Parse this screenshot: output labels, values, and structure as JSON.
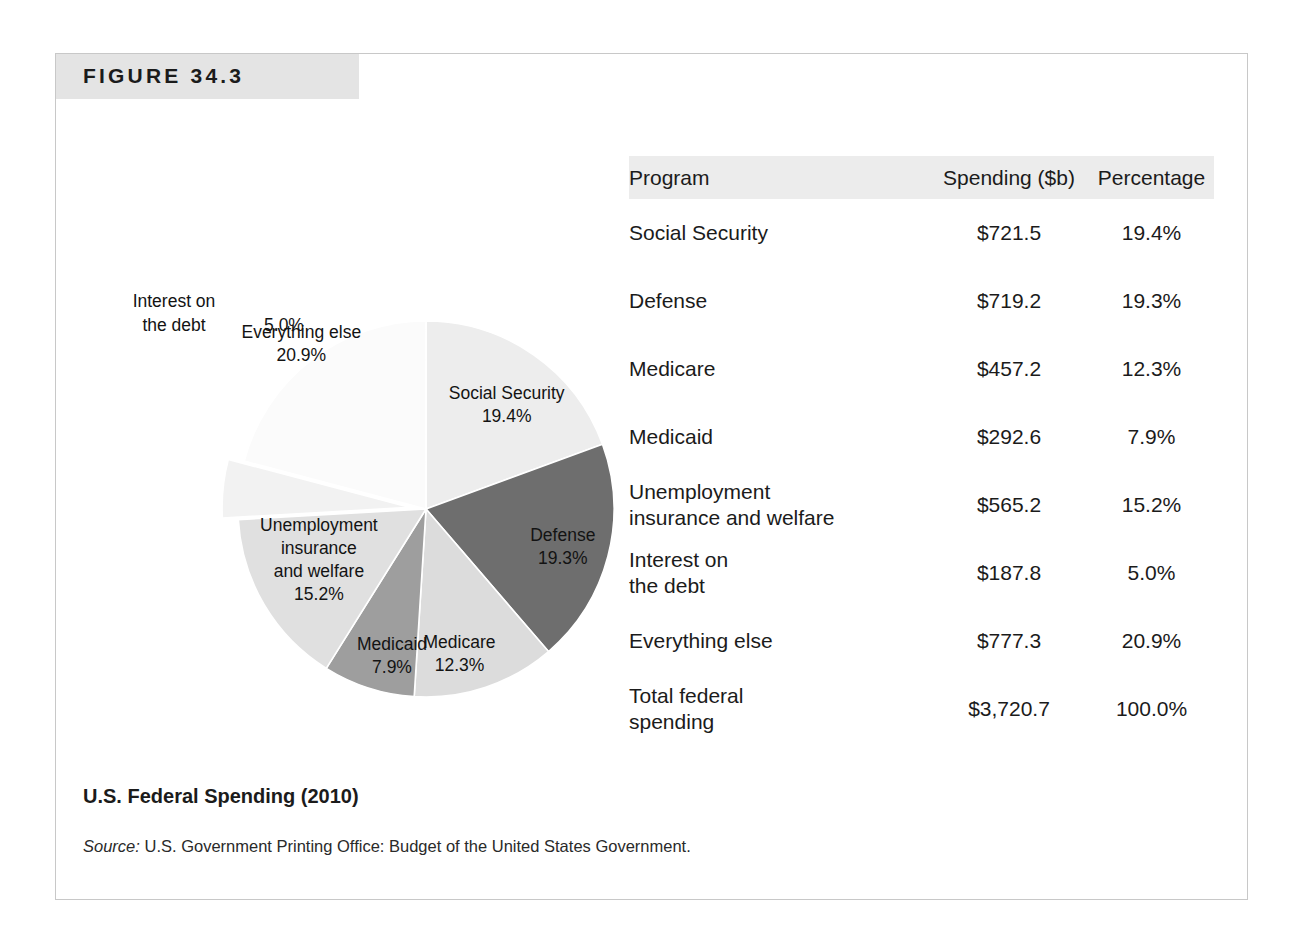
{
  "figure": {
    "number_label": "FIGURE 34.3",
    "caption_title": "U.S. Federal Spending (2010)",
    "source_word": "Source:",
    "source_text": " U.S. Government Printing Office: Budget of the United States Government."
  },
  "table": {
    "headers": {
      "program": "Program",
      "spending": "Spending ($b)",
      "percentage": "Percentage"
    },
    "rows": [
      {
        "program": "Social Security",
        "program_line2": "",
        "spending": "$721.5",
        "percentage": "19.4%"
      },
      {
        "program": "Defense",
        "program_line2": "",
        "spending": "$719.2",
        "percentage": "19.3%"
      },
      {
        "program": "Medicare",
        "program_line2": "",
        "spending": "$457.2",
        "percentage": "12.3%"
      },
      {
        "program": "Medicaid",
        "program_line2": "",
        "spending": "$292.6",
        "percentage": "7.9%"
      },
      {
        "program": "Unemployment",
        "program_line2": "insurance and welfare",
        "spending": "$565.2",
        "percentage": "15.2%"
      },
      {
        "program": "Interest on",
        "program_line2": "the debt",
        "spending": "$187.8",
        "percentage": "5.0%"
      },
      {
        "program": "Everything else",
        "program_line2": "",
        "spending": "$777.3",
        "percentage": "20.9%"
      },
      {
        "program": "Total federal",
        "program_line2": "spending",
        "spending": "$3,720.7",
        "percentage": "100.0%"
      }
    ]
  },
  "chart_data": {
    "type": "pie",
    "title": "U.S. Federal Spending (2010)",
    "value_unit": "$ billions",
    "total_value": 3720.7,
    "legend": "none (direct slice labels)",
    "start_angle_deg": 0,
    "direction": "clockwise",
    "categories": [
      "Social Security",
      "Defense",
      "Medicare",
      "Medicaid",
      "Unemployment insurance and welfare",
      "Interest on the debt",
      "Everything else"
    ],
    "values": [
      721.5,
      719.2,
      457.2,
      292.6,
      565.2,
      187.8,
      777.3
    ],
    "percentages": [
      19.4,
      19.3,
      12.3,
      7.9,
      15.2,
      5.0,
      20.9
    ],
    "colors": [
      "#ededed",
      "#6e6e6e",
      "#dcdcdc",
      "#9e9e9e",
      "#e0e0e0",
      "#f2f2f2",
      "#fbfbfb"
    ],
    "slices": [
      {
        "label_line1": "Social Security",
        "label_line2": "19.4%",
        "value": 721.5,
        "percentage": 19.4,
        "color": "#ededed",
        "exploded": false
      },
      {
        "label_line1": "Defense",
        "label_line2": "19.3%",
        "value": 719.2,
        "percentage": 19.3,
        "color": "#6e6e6e",
        "exploded": false
      },
      {
        "label_line1": "Medicare",
        "label_line2": "12.3%",
        "value": 457.2,
        "percentage": 12.3,
        "color": "#dcdcdc",
        "exploded": false
      },
      {
        "label_line1": "Medicaid",
        "label_line2": "7.9%",
        "value": 292.6,
        "percentage": 7.9,
        "color": "#9e9e9e",
        "exploded": false
      },
      {
        "label_line1": "Unemployment",
        "label_line2": "insurance",
        "label_line3": "and welfare",
        "label_line4": "15.2%",
        "value": 565.2,
        "percentage": 15.2,
        "color": "#e0e0e0",
        "exploded": false
      },
      {
        "label_line1": "Interest on",
        "label_line2": "the debt",
        "label_line3": "5.0%",
        "value": 187.8,
        "percentage": 5.0,
        "color": "#f2f2f2",
        "exploded": true
      },
      {
        "label_line1": "Everything else",
        "label_line2": "20.9%",
        "value": 777.3,
        "percentage": 20.9,
        "color": "#fbfbfb",
        "exploded": false
      }
    ]
  }
}
